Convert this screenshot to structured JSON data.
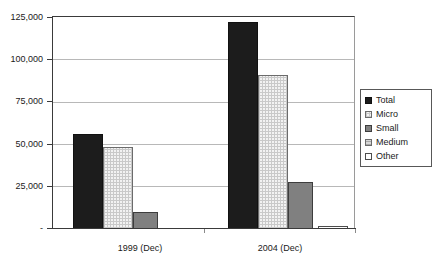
{
  "chart_data": {
    "type": "bar",
    "title": "",
    "subtitle": "",
    "xlabel": "",
    "ylabel": "",
    "categories": [
      "1999 (Dec)",
      "2004 (Dec)"
    ],
    "series": [
      {
        "name": "Total",
        "values": [
          56000,
          122000
        ],
        "swatch": "solid-black"
      },
      {
        "name": "Micro",
        "values": [
          48500,
          91000
        ],
        "swatch": "light-checker"
      },
      {
        "name": "Small",
        "values": [
          9800,
          27500
        ],
        "swatch": "mid-gray"
      },
      {
        "name": "Medium",
        "values": [
          0,
          0
        ],
        "swatch": "light-gray-hatch"
      },
      {
        "name": "Other",
        "values": [
          0,
          1800
        ],
        "swatch": "white"
      }
    ],
    "ylim": [
      0,
      125000
    ],
    "ytick_values": [
      0,
      25000,
      50000,
      75000,
      100000,
      125000
    ],
    "ytick_labels": [
      "-",
      "25,000",
      "50,000",
      "75,000",
      "100,000",
      "125,000"
    ],
    "grid": true,
    "legend_position": "right",
    "colors": {
      "total": "#1c1c1c",
      "micro": "#f2f2f2",
      "small": "#808080",
      "medium": "#d8d8d8",
      "other": "#ffffff",
      "gridline": "#b8b8b8",
      "axis": "#3a3a3a",
      "text": "#1a1a1a",
      "background": "#ffffff"
    }
  },
  "legend": {
    "items": [
      {
        "label": "Total"
      },
      {
        "label": "Micro"
      },
      {
        "label": "Small"
      },
      {
        "label": "Medium"
      },
      {
        "label": "Other"
      }
    ]
  },
  "axes": {
    "y": {
      "t125000": "125,000",
      "t100000": "100,000",
      "t75000": "75,000",
      "t50000": "50,000",
      "t25000": "25,000",
      "t0": "-"
    },
    "x": {
      "cat0": "1999 (Dec)",
      "cat1": "2004 (Dec)"
    }
  }
}
